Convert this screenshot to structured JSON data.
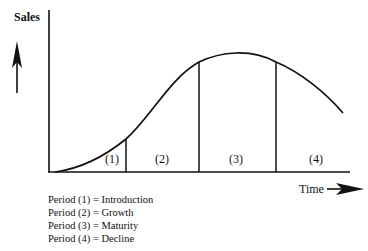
{
  "diagram": {
    "y_axis_label": "Sales",
    "x_axis_label": "Time",
    "periods": [
      {
        "label": "(1)",
        "name": "Introduction"
      },
      {
        "label": "(2)",
        "name": "Growth"
      },
      {
        "label": "(3)",
        "name": "Maturity"
      },
      {
        "label": "(4)",
        "name": "Decline"
      }
    ],
    "legend": [
      "Period (1) = Introduction",
      "Period (2) = Growth",
      "Period (3) = Maturity",
      "Period (4) = Decline"
    ],
    "colors": {
      "line": "#111111",
      "background": "#ffffff"
    }
  }
}
